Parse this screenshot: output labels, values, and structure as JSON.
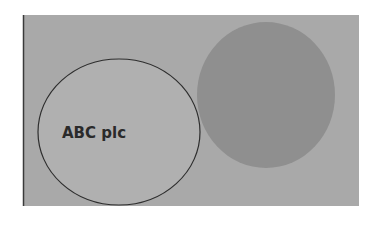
{
  "diagram": {
    "background": {
      "x": 23,
      "y": 15,
      "width": 336,
      "height": 191,
      "fill": "#a9a9a9",
      "left_edge": "#3a3a3a"
    },
    "circles": [
      {
        "id": "abc-plc",
        "label": "ABC plc",
        "cx": 119,
        "cy": 132,
        "rx": 81,
        "ry": 73,
        "fill": "#b0b0b0",
        "stroke": "#2e2e2e"
      },
      {
        "id": "other-entity",
        "label": "",
        "cx": 266,
        "cy": 95,
        "rx": 69,
        "ry": 73,
        "fill": "#8f8f8f",
        "stroke": "none"
      }
    ],
    "text_color": "#2a2a2a"
  }
}
